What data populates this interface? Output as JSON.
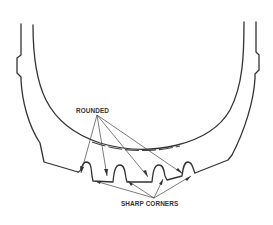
{
  "diagram": {
    "type": "technical-cross-section",
    "labels": {
      "rounded": "ROUNDED",
      "sharp_corners": "SHARP CORNERS"
    },
    "callouts": [
      {
        "label": "ROUNDED",
        "target_count": 4,
        "points_to": "rounded groove tops"
      },
      {
        "label": "SHARP CORNERS",
        "target_count": 4,
        "points_to": "sharp groove bottom corners"
      }
    ],
    "colors": {
      "line": "#333333",
      "background": "#ffffff"
    }
  }
}
